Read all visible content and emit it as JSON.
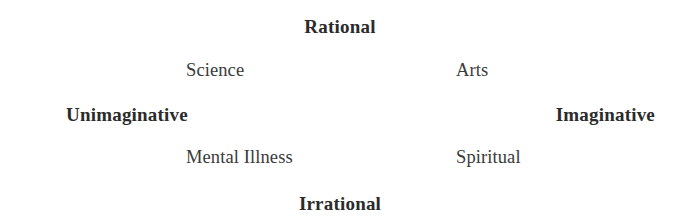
{
  "page": {
    "background_color": "#ffffff",
    "text_color": "#2b2b2b",
    "quadrant_text_color": "#3a3a3a",
    "width": 680,
    "height": 224
  },
  "chart_data": {
    "type": "scatter",
    "title": "",
    "subtitle": "",
    "xlabel": "",
    "ylabel": "",
    "grid": false,
    "legend": "none",
    "axes": {
      "vertical": {
        "positive_pole": "Rational",
        "negative_pole": "Irrational"
      },
      "horizontal": {
        "negative_pole": "Unimaginative",
        "positive_pole": "Imaginative"
      }
    },
    "xlim": [
      -1,
      1
    ],
    "ylim": [
      -1,
      1
    ],
    "annotations": [
      {
        "label": "Science",
        "x": -0.42,
        "y": 0.42,
        "quadrant": "upper-left"
      },
      {
        "label": "Arts",
        "x": 0.42,
        "y": 0.42,
        "quadrant": "upper-right"
      },
      {
        "label": "Mental Illness",
        "x": -0.42,
        "y": -0.42,
        "quadrant": "lower-left"
      },
      {
        "label": "Spiritual",
        "x": 0.42,
        "y": -0.42,
        "quadrant": "lower-right"
      }
    ]
  },
  "axis_labels": {
    "top": "Rational",
    "bottom": "Irrational",
    "left": "Unimaginative",
    "right": "Imaginative"
  },
  "quadrants": {
    "upper_left": "Science",
    "upper_right": "Arts",
    "lower_left": "Mental Illness",
    "lower_right": "Spiritual"
  }
}
